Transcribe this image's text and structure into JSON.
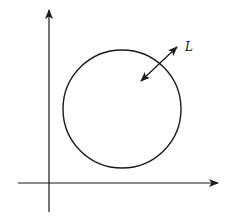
{
  "diagram": {
    "type": "geometry",
    "colors": {
      "stroke": "#1a1a1a",
      "background": "#ffffff"
    },
    "axes": {
      "x_axis": {
        "y": 183,
        "x_start": 18,
        "x_end": 218,
        "arrow": "right"
      },
      "y_axis": {
        "x": 49,
        "y_start": 212,
        "y_end": 10,
        "arrow": "up"
      }
    },
    "circle": {
      "cx": 122,
      "cy": 109,
      "r": 59
    },
    "double_arrow": {
      "x1": 141,
      "y1": 81,
      "x2": 177,
      "y2": 47,
      "label": "L"
    }
  }
}
